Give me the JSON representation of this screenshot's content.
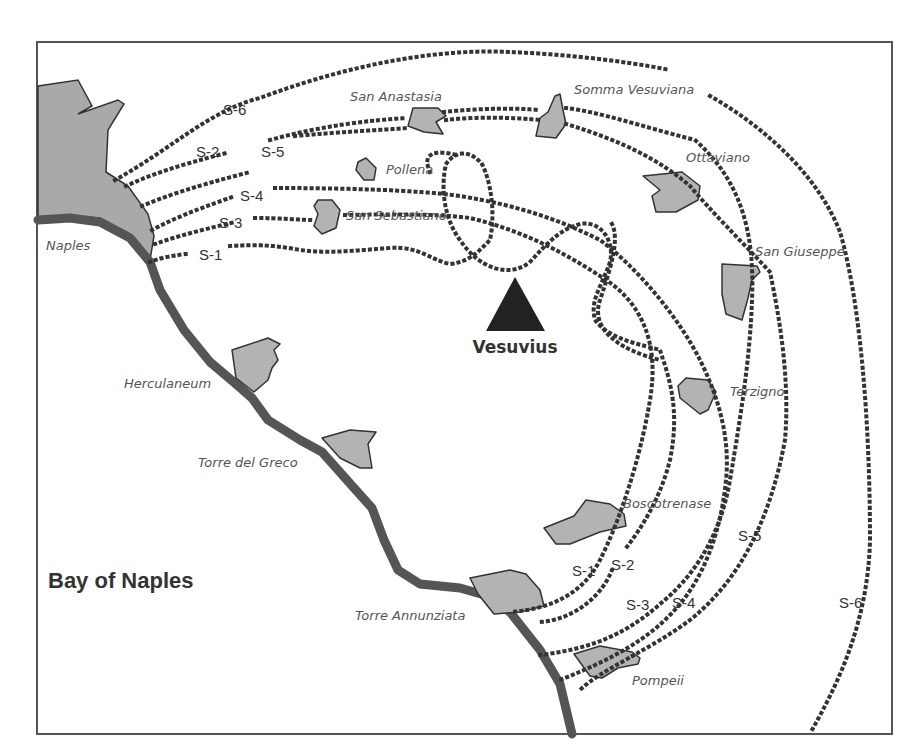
{
  "map": {
    "volcano": {
      "name": "Vesuvius",
      "icon": "triangle-icon"
    },
    "water_body": "Bay of Naples",
    "towns": [
      {
        "id": "naples",
        "label": "Naples"
      },
      {
        "id": "san-anastasia",
        "label": "San Anastasia"
      },
      {
        "id": "somma-vesuviana",
        "label": "Somma Vesuviana"
      },
      {
        "id": "pollena",
        "label": "Pollena"
      },
      {
        "id": "san-sebastiano",
        "label": "San Sebastiano"
      },
      {
        "id": "ottaviano",
        "label": "Ottaviano"
      },
      {
        "id": "san-giuseppe",
        "label": "San Giuseppe"
      },
      {
        "id": "terzigno",
        "label": "Terzigno"
      },
      {
        "id": "herculaneum",
        "label": "Herculaneum"
      },
      {
        "id": "torre-del-greco",
        "label": "Torre del Greco"
      },
      {
        "id": "boscotrenase",
        "label": "Boscotrenase"
      },
      {
        "id": "torre-annunziata",
        "label": "Torre Annunziata"
      },
      {
        "id": "pompeii",
        "label": "Pompeii"
      }
    ],
    "routes": [
      {
        "id": "S-1",
        "label": "S-1"
      },
      {
        "id": "S-2",
        "label": "S-2"
      },
      {
        "id": "S-3",
        "label": "S-3"
      },
      {
        "id": "S-4",
        "label": "S-4"
      },
      {
        "id": "S-5",
        "label": "S-5"
      },
      {
        "id": "S-6",
        "label": "S-6"
      }
    ],
    "colors": {
      "land": "#a9a9a9",
      "town": "#b3b3b3",
      "coast": "#555555",
      "route": "#333333",
      "volcano": "#222222"
    }
  }
}
